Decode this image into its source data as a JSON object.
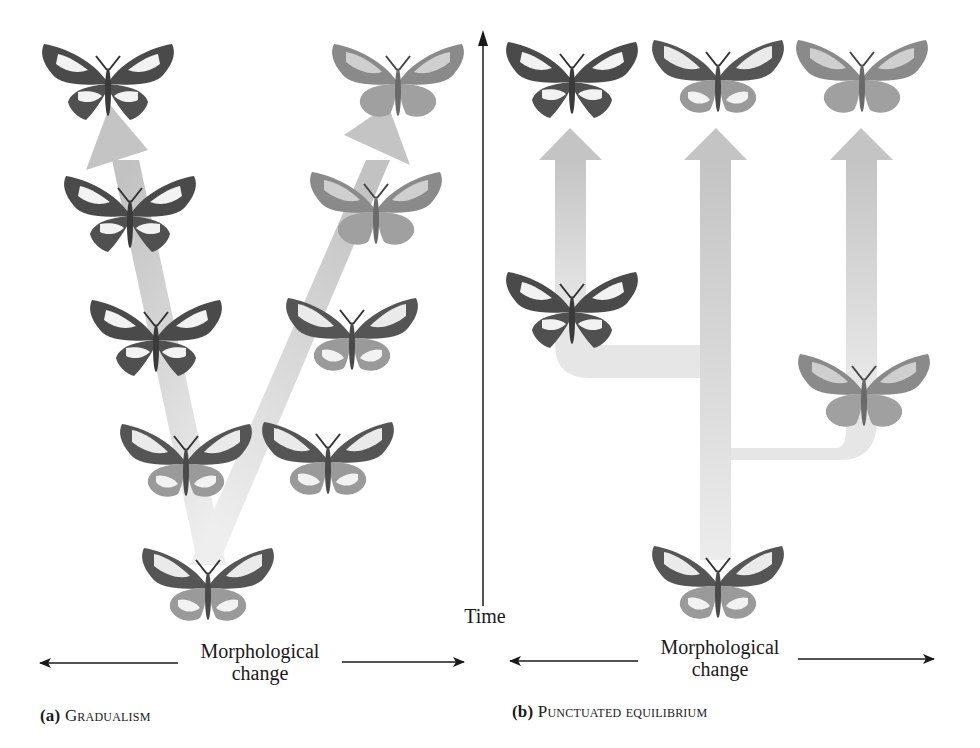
{
  "figure": {
    "panels": [
      {
        "id": "a",
        "letter": "(a)",
        "title": "Gradualism",
        "x_axis_label_line1": "Morphological",
        "x_axis_label_line2": "change",
        "lineages": [
          {
            "name": "left-lineage",
            "style": "dark-white-band",
            "generations": 5
          },
          {
            "name": "right-lineage",
            "style": "light-gray",
            "generations": 5
          }
        ]
      },
      {
        "id": "b",
        "letter": "(b)",
        "title": "Punctuated equilibrium",
        "x_axis_label_line1": "Morphological",
        "x_axis_label_line2": "change",
        "lineages": [
          {
            "name": "ancestral-lineage",
            "style": "medium",
            "branch": "center"
          },
          {
            "name": "left-branch",
            "style": "dark-white-band",
            "branch": "left"
          },
          {
            "name": "right-branch",
            "style": "light-gray",
            "branch": "right"
          }
        ]
      }
    ],
    "y_axis_label": "Time",
    "colors": {
      "arrow_fill": "#c8c8c8",
      "branch_fill": "#e6e6e6",
      "ink": "#1a1a1a",
      "wing_dark": "#4a4a4a",
      "wing_light": "#f2f2f2",
      "wing_gray": "#8a8a8a"
    }
  }
}
